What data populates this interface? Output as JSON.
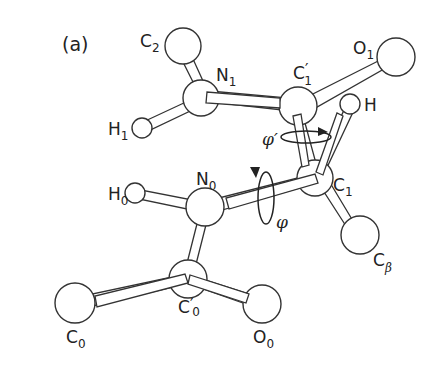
{
  "figure": {
    "panel_label": "(a)",
    "atoms": [
      {
        "id": "C2",
        "label": "C",
        "sub": "2",
        "prime": false
      },
      {
        "id": "N1",
        "label": "N",
        "sub": "1",
        "prime": false
      },
      {
        "id": "H1",
        "label": "H",
        "sub": "1",
        "prime": false
      },
      {
        "id": "C1p",
        "label": "C",
        "sub": "1",
        "prime": true
      },
      {
        "id": "O1",
        "label": "O",
        "sub": "1",
        "prime": false
      },
      {
        "id": "H",
        "label": "H",
        "sub": "",
        "prime": false
      },
      {
        "id": "C1",
        "label": "C",
        "sub": "1",
        "prime": false
      },
      {
        "id": "Cb",
        "label": "C",
        "sub": "β",
        "prime": false
      },
      {
        "id": "H0",
        "label": "H",
        "sub": "0",
        "prime": false
      },
      {
        "id": "N0",
        "label": "N",
        "sub": "0",
        "prime": false
      },
      {
        "id": "C0p",
        "label": "C",
        "sub": "0",
        "prime": true
      },
      {
        "id": "C0",
        "label": "C",
        "sub": "0",
        "prime": false
      },
      {
        "id": "O0",
        "label": "O",
        "sub": "0",
        "prime": false
      }
    ],
    "bonds": [
      [
        "C2",
        "N1"
      ],
      [
        "H1",
        "N1"
      ],
      [
        "N1",
        "C1p"
      ],
      [
        "C1p",
        "O1"
      ],
      [
        "C1p",
        "C1"
      ],
      [
        "C1",
        "H"
      ],
      [
        "C1",
        "Cb"
      ],
      [
        "N0",
        "C1"
      ],
      [
        "H0",
        "N0"
      ],
      [
        "N0",
        "C0p"
      ],
      [
        "C0",
        "C0p"
      ],
      [
        "C0p",
        "O0"
      ]
    ],
    "dihedrals": [
      {
        "symbol": "φ′",
        "axis": "C1–C′1"
      },
      {
        "symbol": "φ",
        "axis": "N0–C1"
      }
    ]
  }
}
